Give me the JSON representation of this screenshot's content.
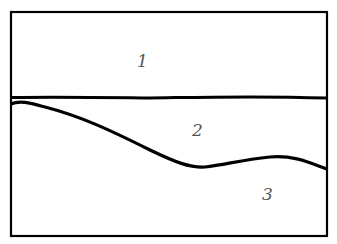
{
  "diagram": {
    "regions": [
      {
        "id": 1,
        "label": "1"
      },
      {
        "id": 2,
        "label": "2"
      },
      {
        "id": 3,
        "label": "3"
      }
    ],
    "colors": {
      "stroke": "#000000",
      "label": "#555555",
      "background": "#ffffff"
    }
  }
}
